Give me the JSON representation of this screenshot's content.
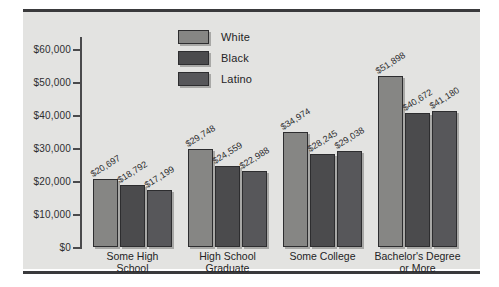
{
  "chart_data": {
    "type": "bar",
    "title": "",
    "xlabel": "",
    "ylabel": "",
    "ylim": [
      0,
      60000
    ],
    "grid": false,
    "legend_position": "top-center",
    "y_ticks": [
      "$0",
      "$10,000",
      "$20,000",
      "$30,000",
      "$40,000",
      "$50,000",
      "$60,000"
    ],
    "y_tick_values": [
      0,
      10000,
      20000,
      30000,
      40000,
      50000,
      60000
    ],
    "categories": [
      "Some High\nSchool",
      "High School\nGraduate",
      "Some College",
      "Bachelor's Degree\nor More"
    ],
    "series": [
      {
        "name": "White",
        "color": "#868684",
        "values": [
          20697,
          29748,
          34974,
          51898
        ],
        "labels": [
          "$20,697",
          "$29,748",
          "$34,974",
          "$51,898"
        ]
      },
      {
        "name": "Black",
        "color": "#4b4b4d",
        "values": [
          18792,
          24559,
          28245,
          40672
        ],
        "labels": [
          "$18,792",
          "$24,559",
          "$28,245",
          "$40,672"
        ]
      },
      {
        "name": "Latino",
        "color": "#57575a",
        "values": [
          17199,
          22988,
          29038,
          41180
        ],
        "labels": [
          "$17,199",
          "$22,988",
          "$29,038",
          "$41,180"
        ]
      }
    ]
  },
  "legend": {
    "items": [
      {
        "label": "White",
        "key": "white"
      },
      {
        "label": "Black",
        "key": "black"
      },
      {
        "label": "Latino",
        "key": "latino"
      }
    ]
  }
}
